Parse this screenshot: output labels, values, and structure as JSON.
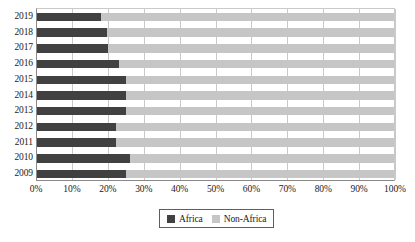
{
  "chart_data": {
    "type": "bar",
    "subtype": "stacked-horizontal-100-percent",
    "title": "",
    "subtitle": "",
    "xlabel": "",
    "ylabel": "",
    "xlim": [
      0,
      100
    ],
    "grid": true,
    "legend_position": "bottom-center",
    "orientation": "horizontal",
    "categories": [
      "2019",
      "2018",
      "2017",
      "2016",
      "2015",
      "2014",
      "2013",
      "2012",
      "2011",
      "2010",
      "2009"
    ],
    "x_tick_labels": [
      "0%",
      "10%",
      "20%",
      "30%",
      "40%",
      "50%",
      "60%",
      "70%",
      "80%",
      "90%",
      "100%"
    ],
    "x_tick_values": [
      0,
      10,
      20,
      30,
      40,
      50,
      60,
      70,
      80,
      90,
      100
    ],
    "series": [
      {
        "name": "Africa",
        "color": "#414141",
        "values": [
          18,
          19.5,
          20,
          23,
          25,
          25,
          25,
          22,
          22,
          26,
          25
        ]
      },
      {
        "name": "Non-Africa",
        "color": "#c6c6c6",
        "values": [
          82,
          80.5,
          80,
          77,
          75,
          75,
          75,
          78,
          78,
          74,
          75
        ]
      }
    ]
  },
  "legend": {
    "items": [
      {
        "label": "Africa",
        "swatch": "africa"
      },
      {
        "label": "Non-Africa",
        "swatch": "nonafrica"
      }
    ]
  },
  "colors": {
    "africa": "#414141",
    "non_africa": "#c6c6c6",
    "gridline": "#c9c9c9",
    "axis": "#8a8a8a",
    "text": "#1a1a1a",
    "background": "#ffffff"
  }
}
